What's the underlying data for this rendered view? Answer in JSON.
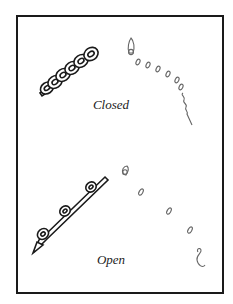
{
  "figure": {
    "panels": [
      {
        "id": "closed",
        "caption": "Closed",
        "coil_state": "tightly wound",
        "side_view_rings": 7
      },
      {
        "id": "open",
        "caption": "Open",
        "coil_state": "extended",
        "side_view_rings": 4
      }
    ],
    "colors": {
      "frame": "#1a1a1a",
      "coil_ink": "#1a1a1a",
      "ring_ink": "#666666",
      "background": "#ffffff"
    }
  }
}
